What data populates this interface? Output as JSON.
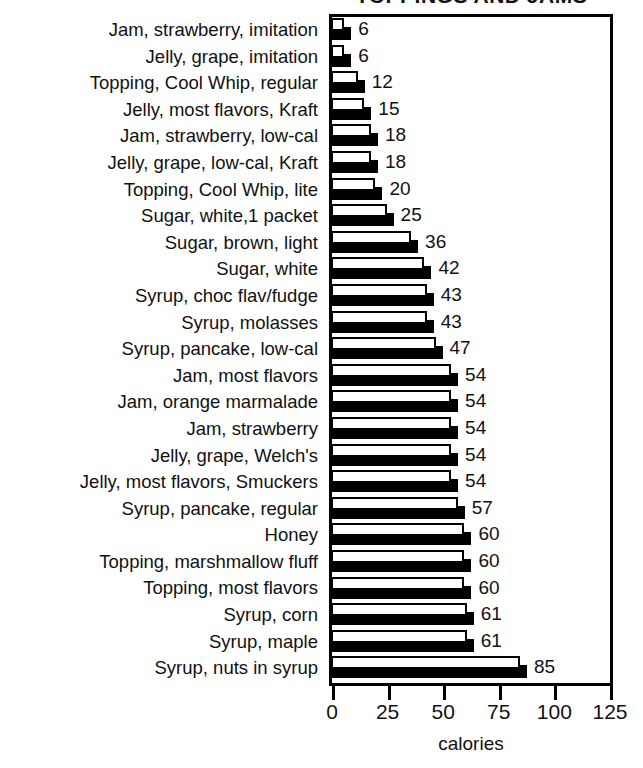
{
  "chart_data": {
    "type": "bar",
    "orientation": "horizontal",
    "title": "TOPPINGS AND JAMS",
    "xlabel": "calories",
    "ylabel": "",
    "xlim": [
      0,
      125
    ],
    "xticks": [
      0,
      25,
      50,
      75,
      100,
      125
    ],
    "xtick_labels": [
      "0",
      "25",
      "50",
      "75",
      "100",
      "125"
    ],
    "grid": false,
    "legend": null,
    "value_labels_shown": true,
    "categories": [
      "Jam, strawberry, imitation",
      "Jelly, grape, imitation",
      "Topping, Cool Whip, regular",
      "Jelly, most flavors, Kraft",
      "Jam, strawberry, low-cal",
      "Jelly, grape, low-cal, Kraft",
      "Topping, Cool Whip, lite",
      "Sugar, white,1 packet",
      "Sugar, brown, light",
      "Sugar, white",
      "Syrup, choc flav/fudge",
      "Syrup, molasses",
      "Syrup, pancake, low-cal",
      "Jam, most flavors",
      "Jam, orange marmalade",
      "Jam, strawberry",
      "Jelly, grape, Welch's",
      "Jelly, most flavors, Smuckers",
      "Syrup, pancake, regular",
      "Honey",
      "Topping, marshmallow fluff",
      "Topping, most flavors",
      "Syrup, corn",
      "Syrup, maple",
      "Syrup, nuts in syrup"
    ],
    "values": [
      6,
      6,
      12,
      15,
      18,
      18,
      20,
      25,
      36,
      42,
      43,
      43,
      47,
      54,
      54,
      54,
      54,
      54,
      57,
      60,
      60,
      60,
      61,
      61,
      85
    ],
    "value_label_texts": [
      "6",
      "6",
      "12",
      "15",
      "18",
      "18",
      "20",
      "25",
      "36",
      "42",
      "43",
      "43",
      "47",
      "54",
      "54",
      "54",
      "54",
      "54",
      "57",
      "60",
      "60",
      "60",
      "61",
      "61",
      "85"
    ],
    "colors": {
      "bar_face": "#ffffff",
      "bar_outline": "#000000",
      "bar_shadow": "#000000",
      "axis": "#000000",
      "text": "#000000",
      "background": "#ffffff"
    }
  }
}
